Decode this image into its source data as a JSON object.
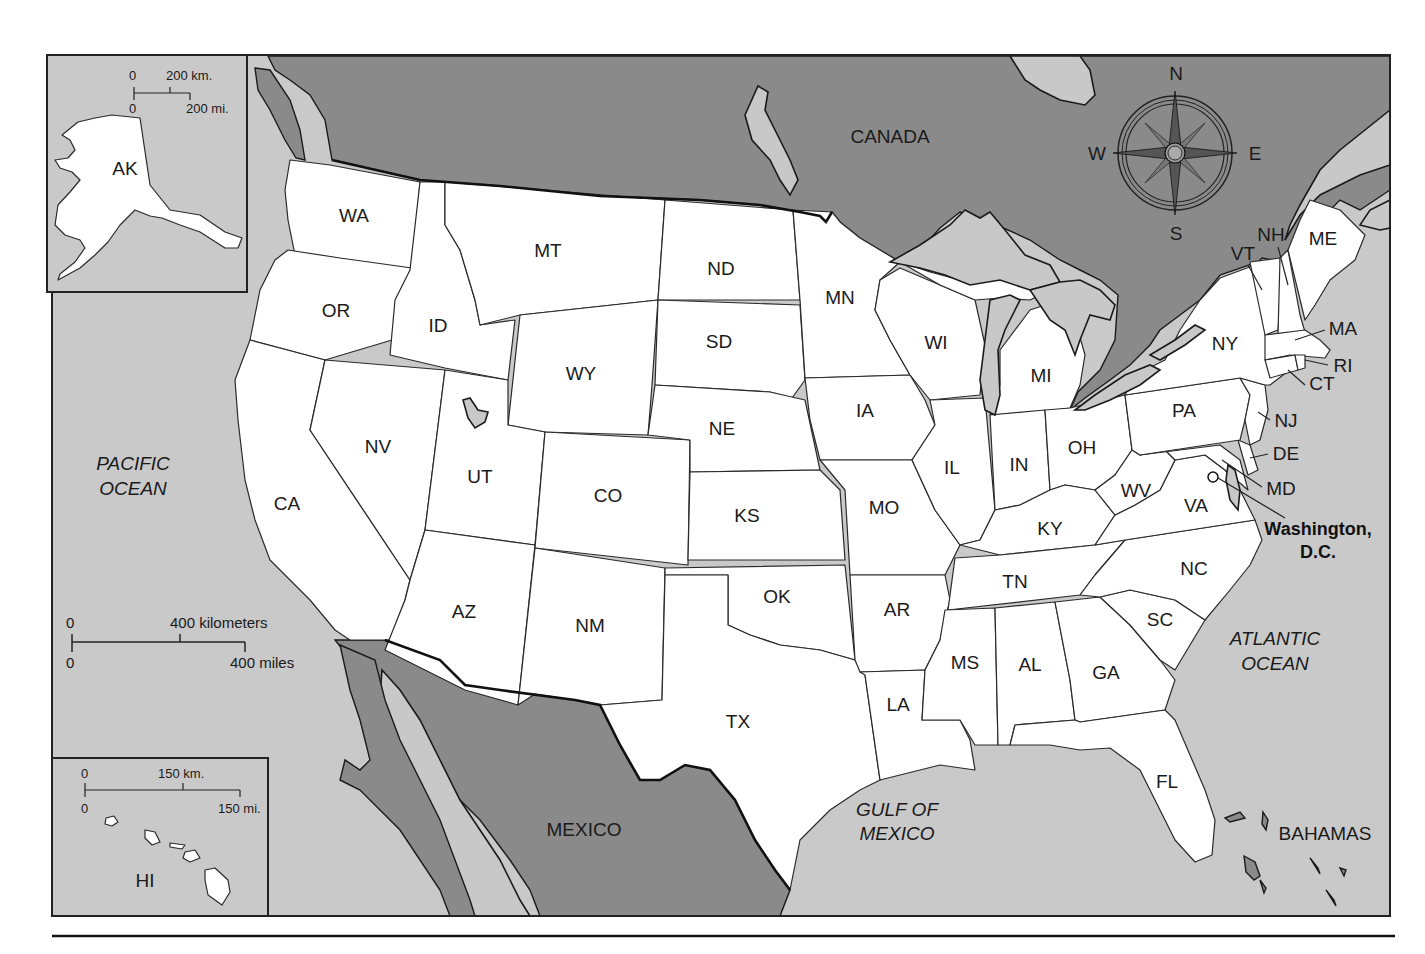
{
  "map": {
    "title": "United States",
    "colors": {
      "ocean": "#c9c9c9",
      "foreign_land": "#8a8a8a",
      "us_states": "#ffffff",
      "lakes": "#c8c8c8",
      "outline": "#1a1a1a"
    },
    "countries": [
      {
        "id": "canada",
        "label": "CANADA"
      },
      {
        "id": "mexico",
        "label": "MEXICO"
      },
      {
        "id": "bahamas",
        "label": "BAHAMAS"
      }
    ],
    "water_bodies": [
      {
        "id": "pacific",
        "line1": "PACIFIC",
        "line2": "OCEAN"
      },
      {
        "id": "atlantic",
        "line1": "ATLANTIC",
        "line2": "OCEAN"
      },
      {
        "id": "gulf",
        "line1": "GULF OF",
        "line2": "MEXICO"
      }
    ],
    "capital": {
      "line1": "Washington,",
      "line2": "D.C.",
      "icon": "star-icon"
    },
    "states": {
      "WA": "WA",
      "OR": "OR",
      "CA": "CA",
      "ID": "ID",
      "NV": "NV",
      "MT": "MT",
      "WY": "WY",
      "UT": "UT",
      "AZ": "AZ",
      "CO": "CO",
      "NM": "NM",
      "ND": "ND",
      "SD": "SD",
      "NE": "NE",
      "KS": "KS",
      "OK": "OK",
      "TX": "TX",
      "MN": "MN",
      "IA": "IA",
      "MO": "MO",
      "AR": "AR",
      "LA": "LA",
      "WI": "WI",
      "IL": "IL",
      "MI": "MI",
      "IN": "IN",
      "OH": "OH",
      "KY": "KY",
      "TN": "TN",
      "MS": "MS",
      "AL": "AL",
      "GA": "GA",
      "FL": "FL",
      "SC": "SC",
      "NC": "NC",
      "VA": "VA",
      "WV": "WV",
      "PA": "PA",
      "NY": "NY",
      "VT": "VT",
      "NH": "NH",
      "ME": "ME",
      "MA": "MA",
      "RI": "RI",
      "CT": "CT",
      "NJ": "NJ",
      "DE": "DE",
      "MD": "MD",
      "AK": "AK",
      "HI": "HI"
    },
    "compass": {
      "n": "N",
      "s": "S",
      "e": "E",
      "w": "W"
    },
    "main_scale": {
      "km_zero": "0",
      "km_label": "400 kilometers",
      "mi_zero": "0",
      "mi_label": "400 miles"
    },
    "alaska_inset": {
      "km_zero": "0",
      "km_label": "200 km.",
      "mi_zero": "0",
      "mi_label": "200 mi."
    },
    "hawaii_inset": {
      "km_zero": "0",
      "km_label": "150 km.",
      "mi_zero": "0",
      "mi_label": "150 mi."
    }
  }
}
